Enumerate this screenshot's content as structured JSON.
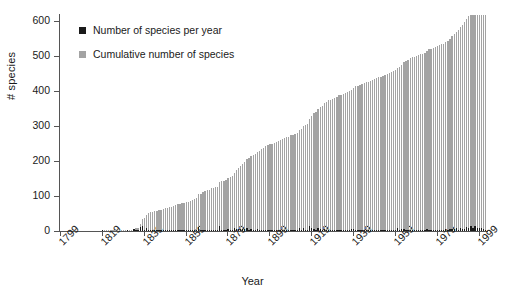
{
  "chart_data": {
    "type": "bar",
    "title": "",
    "xlabel": "Year",
    "ylabel": "# species",
    "xlim": [
      1799,
      2010
    ],
    "ylim": [
      0,
      620
    ],
    "grid": false,
    "legend_position": "top-left",
    "y_ticks": [
      0,
      100,
      200,
      300,
      400,
      500,
      600
    ],
    "x_ticks": [
      1799,
      1819,
      1839,
      1859,
      1879,
      1899,
      1919,
      1939,
      1959,
      1979,
      1999
    ],
    "colors": {
      "per_year": "#1a1a1a",
      "cumulative": "#a3a3a3",
      "axis": "#555555",
      "text": "#1a1a1a",
      "background": "#ffffff"
    },
    "series": [
      {
        "name": "Number of species per year",
        "key": "per_year",
        "color": "#1a1a1a",
        "values": [
          0,
          0,
          0,
          0,
          0,
          0,
          0,
          0,
          0,
          0,
          0,
          0,
          0,
          0,
          0,
          0,
          0,
          0,
          0,
          0,
          1,
          0,
          0,
          0,
          0,
          0,
          0,
          0,
          0,
          0,
          0,
          0,
          1,
          0,
          0,
          5,
          1,
          2,
          11,
          13,
          3,
          10,
          4,
          2,
          1,
          2,
          1,
          2,
          1,
          2,
          3,
          1,
          2,
          2,
          2,
          2,
          2,
          1,
          2,
          1,
          2,
          2,
          3,
          3,
          2,
          2,
          11,
          2,
          4,
          2,
          4,
          1,
          4,
          2,
          2,
          1,
          13,
          2,
          2,
          3,
          5,
          3,
          3,
          8,
          7,
          6,
          7,
          5,
          6,
          8,
          4,
          5,
          3,
          4,
          6,
          3,
          4,
          4,
          4,
          4,
          2,
          2,
          2,
          3,
          2,
          2,
          3,
          4,
          2,
          2,
          3,
          2,
          3,
          2,
          8,
          4,
          9,
          2,
          3,
          13,
          10,
          7,
          4,
          9,
          6,
          3,
          7,
          4,
          4,
          2,
          2,
          4,
          3,
          4,
          2,
          2,
          3,
          2,
          2,
          5,
          6,
          3,
          2,
          3,
          2,
          2,
          3,
          2,
          2,
          2,
          4,
          2,
          2,
          2,
          2,
          2,
          4,
          3,
          3,
          2,
          2,
          8,
          3,
          5,
          7,
          4,
          3,
          4,
          3,
          2,
          2,
          2,
          3,
          2,
          3,
          5,
          4,
          2,
          2,
          3,
          2,
          3,
          2,
          2,
          5,
          4,
          6,
          7,
          5,
          8,
          4,
          9,
          6,
          7,
          11,
          8,
          13,
          9,
          15,
          10,
          8,
          9,
          6,
          4
        ]
      },
      {
        "name": "Cumulative number of species",
        "key": "cumulative",
        "color": "#a3a3a3",
        "values": [
          0,
          0,
          0,
          0,
          0,
          0,
          0,
          0,
          0,
          0,
          0,
          0,
          0,
          0,
          0,
          0,
          0,
          0,
          0,
          0,
          1,
          1,
          1,
          1,
          1,
          1,
          1,
          1,
          1,
          1,
          1,
          1,
          2,
          2,
          2,
          7,
          8,
          10,
          21,
          34,
          37,
          47,
          51,
          53,
          54,
          56,
          57,
          59,
          60,
          62,
          65,
          66,
          68,
          70,
          72,
          74,
          76,
          77,
          79,
          80,
          82,
          84,
          87,
          90,
          92,
          94,
          105,
          107,
          111,
          113,
          117,
          118,
          122,
          124,
          126,
          127,
          140,
          142,
          144,
          147,
          152,
          155,
          158,
          166,
          173,
          179,
          186,
          191,
          197,
          205,
          209,
          214,
          217,
          221,
          227,
          230,
          234,
          238,
          242,
          246,
          248,
          250,
          252,
          255,
          257,
          259,
          262,
          266,
          268,
          270,
          273,
          275,
          278,
          280,
          288,
          292,
          301,
          303,
          306,
          319,
          329,
          336,
          340,
          349,
          355,
          358,
          365,
          369,
          373,
          375,
          377,
          381,
          384,
          388,
          390,
          392,
          395,
          397,
          399,
          404,
          410,
          413,
          415,
          418,
          420,
          422,
          425,
          427,
          429,
          431,
          435,
          437,
          439,
          441,
          443,
          445,
          449,
          452,
          455,
          457,
          459,
          467,
          470,
          475,
          482,
          486,
          489,
          493,
          496,
          498,
          500,
          502,
          505,
          507,
          510,
          515,
          519,
          521,
          523,
          526,
          528,
          531,
          533,
          535,
          540,
          544,
          550,
          557,
          562,
          570,
          574,
          583,
          589,
          596,
          607,
          615,
          618,
          618,
          618,
          618,
          618,
          618,
          618,
          618
        ]
      }
    ],
    "x_start_year": 1799,
    "note_max_cumulative": 618
  },
  "legend": {
    "items": [
      {
        "label": "Number of species per year",
        "color": "#1a1a1a"
      },
      {
        "label": "Cumulative number of species",
        "color": "#a3a3a3"
      }
    ]
  },
  "axes": {
    "y_title": "# species",
    "x_title": "Year"
  }
}
